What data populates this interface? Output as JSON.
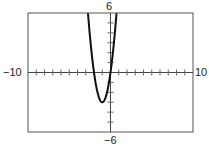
{
  "chart_data": {
    "type": "line",
    "title": "",
    "xlabel": "",
    "ylabel": "",
    "xlim": [
      -10,
      10
    ],
    "ylim": [
      -6,
      6
    ],
    "xtick_step": 1,
    "ytick_step": 1,
    "grid": false,
    "legend": null,
    "window_labels": {
      "xmin": "−10",
      "xmax": "10",
      "ymin": "−6",
      "ymax": "6"
    },
    "series": [
      {
        "name": "parabola",
        "equation": "y = 3x^2 + 6x",
        "vertex": [
          -1,
          -3
        ],
        "x_intercepts": [
          -2,
          0
        ],
        "x": [
          -2.73,
          -2.5,
          -2,
          -1.5,
          -1,
          -0.5,
          0,
          0.5,
          0.73
        ],
        "y": [
          6,
          3.75,
          0,
          -2.25,
          -3,
          -2.25,
          0,
          3.75,
          6
        ],
        "color": "#111111"
      }
    ]
  }
}
